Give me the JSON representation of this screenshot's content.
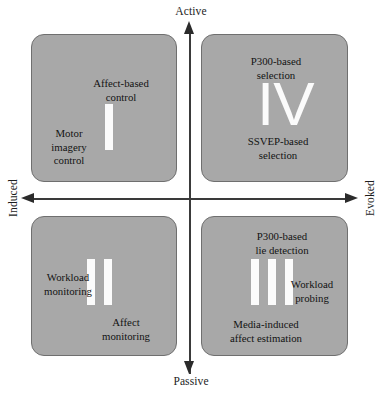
{
  "figure": {
    "type": "quadrant-diagram",
    "title": "",
    "background_color": "#ffffff",
    "box_fill_color": "#a8a8a8",
    "box_border_color": "#6f6f6f",
    "numeral_color": "#fbfbfb",
    "axis_color": "#2b2b2b"
  },
  "axes": {
    "vertical": {
      "top_label": "Active",
      "bottom_label": "Passive"
    },
    "horizontal": {
      "left_label": "Induced",
      "right_label": "Evoked"
    }
  },
  "quadrants": [
    {
      "numeral": "I",
      "position": "top-left",
      "axis_pair": "Induced / Active",
      "items": [
        {
          "label": "Affect-based\ncontrol",
          "placement": "top-center"
        },
        {
          "label": "Motor\nimagery\ncontrol",
          "placement": "middle-left"
        }
      ]
    },
    {
      "numeral": "IV",
      "position": "top-right",
      "axis_pair": "Evoked / Active",
      "items": [
        {
          "label": "P300-based\nselection",
          "placement": "top-center"
        },
        {
          "label": "SSVEP-based\nselection",
          "placement": "bottom-center"
        }
      ]
    },
    {
      "numeral": "II",
      "position": "bottom-left",
      "axis_pair": "Induced / Passive",
      "items": [
        {
          "label": "Workload\nmonitoring",
          "placement": "middle-left"
        },
        {
          "label": "Affect\nmonitoring",
          "placement": "bottom-right"
        }
      ]
    },
    {
      "numeral": "III",
      "position": "bottom-right",
      "axis_pair": "Evoked / Passive",
      "items": [
        {
          "label": "P300-based\nlie detection",
          "placement": "top-right"
        },
        {
          "label": "Workload\nprobing",
          "placement": "middle-right"
        },
        {
          "label": "Media-induced\naffect estimation",
          "placement": "bottom-left"
        }
      ]
    }
  ]
}
